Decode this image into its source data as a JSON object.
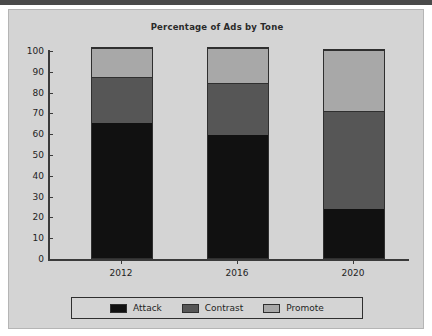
{
  "chart_data": {
    "type": "bar",
    "stacked": true,
    "title": "Percentage of Ads by Tone",
    "xlabel": "",
    "ylabel": "",
    "categories": [
      "2012",
      "2016",
      "2020"
    ],
    "series": [
      {
        "name": "Attack",
        "color": "#111111",
        "values": [
          65,
          59,
          23.5
        ]
      },
      {
        "name": "Contrast",
        "color": "#565656",
        "values": [
          22,
          25,
          47
        ]
      },
      {
        "name": "Promote",
        "color": "#a8a8a8",
        "values": [
          14,
          17,
          29.5
        ]
      }
    ],
    "cumulative_tops": [
      [
        65,
        87,
        101
      ],
      [
        59,
        84,
        101
      ],
      [
        23.5,
        70.5,
        100
      ]
    ],
    "ylim": [
      0,
      100
    ],
    "yticks": [
      0,
      10,
      20,
      30,
      40,
      50,
      60,
      70,
      80,
      90,
      100
    ],
    "ytick_labels": [
      "0",
      "10",
      "20",
      "30",
      "40",
      "50",
      "60",
      "70",
      "80",
      "90",
      "100"
    ],
    "grid": false,
    "legend_position": "bottom"
  },
  "legend": {
    "items": [
      {
        "label": "Attack",
        "swatch": "attack"
      },
      {
        "label": "Contrast",
        "swatch": "contrast"
      },
      {
        "label": "Promote",
        "swatch": "promote"
      }
    ]
  },
  "colors": {
    "attack": "#111111",
    "contrast": "#565656",
    "promote": "#a8a8a8",
    "panel_background": "#d4d4d4",
    "page_background": "#ffffff",
    "axis": "#3a3a3a"
  }
}
